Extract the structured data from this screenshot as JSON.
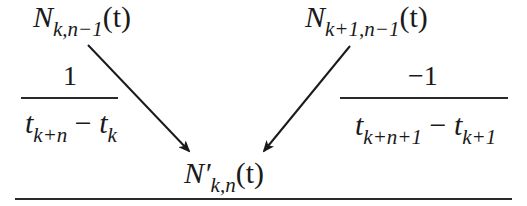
{
  "diagram": {
    "top_left_node": {
      "symbol": "N",
      "subscript": "k,n−1",
      "argument": "(t)"
    },
    "top_right_node": {
      "symbol": "N",
      "subscript": "k+1,n−1",
      "argument": "(t)"
    },
    "bottom_node": {
      "symbol": "N′",
      "subscript": "k,n",
      "argument": "(t)"
    },
    "left_weight": {
      "numerator": "1",
      "denominator_term1": "t",
      "denominator_term1_sub": "k+n",
      "operator": "−",
      "denominator_term2": "t",
      "denominator_term2_sub": "k"
    },
    "right_weight": {
      "numerator": "−1",
      "denominator_term1": "t",
      "denominator_term1_sub": "k+n+1",
      "operator": "−",
      "denominator_term2": "t",
      "denominator_term2_sub": "k+1"
    },
    "edges": [
      {
        "from": "top_left_node",
        "to": "bottom_node"
      },
      {
        "from": "top_right_node",
        "to": "bottom_node"
      }
    ],
    "colors": {
      "ink": "#1a1a1a",
      "background": "#ffffff"
    }
  }
}
